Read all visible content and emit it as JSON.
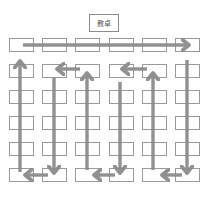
{
  "diagram": {
    "title": "",
    "teacher_desk": {
      "label": "教卓"
    },
    "grid": {
      "rows": 6,
      "columns": 6
    },
    "colors": {
      "desk_border": "#9a9a9a",
      "arrow": "#8c8c8c",
      "background": "#ffffff"
    },
    "flow": [
      {
        "from": "row1-col1",
        "to": "row1-col6",
        "direction": "right"
      },
      {
        "from": "row1-col6",
        "to": "row6-col6",
        "direction": "down"
      },
      {
        "from": "row6-col6",
        "to": "row6-col5",
        "direction": "left"
      },
      {
        "from": "row6-col5",
        "to": "row2-col5",
        "direction": "up"
      },
      {
        "from": "row2-col5",
        "to": "row2-col4",
        "direction": "left"
      },
      {
        "from": "row2-col4",
        "to": "row6-col4",
        "direction": "down"
      },
      {
        "from": "row6-col4",
        "to": "row6-col3",
        "direction": "left"
      },
      {
        "from": "row6-col3",
        "to": "row2-col3",
        "direction": "up"
      },
      {
        "from": "row2-col3",
        "to": "row2-col2",
        "direction": "left"
      },
      {
        "from": "row2-col2",
        "to": "row6-col2",
        "direction": "down"
      },
      {
        "from": "row6-col2",
        "to": "row6-col1",
        "direction": "left"
      },
      {
        "from": "row6-col1",
        "to": "row2-col1",
        "direction": "up"
      }
    ]
  }
}
